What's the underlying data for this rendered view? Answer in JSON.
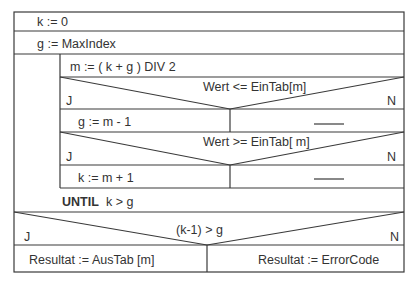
{
  "diagram": {
    "type": "Nassi-Shneiderman structogram",
    "statements": {
      "init_k": "k := 0",
      "init_g": "g := MaxIndex",
      "compute_m": "m := ( k + g )  DIV  2"
    },
    "loop": {
      "keyword": "UNTIL",
      "condition": "k > g",
      "decision1": {
        "condition": "Wert <= EinTab[m]",
        "yes_label": "J",
        "no_label": "N",
        "yes_action": "g := m - 1",
        "no_action": "——"
      },
      "decision2": {
        "condition": "Wert >= EinTab[ m]",
        "yes_label": "J",
        "no_label": "N",
        "yes_action": "k := m + 1",
        "no_action": "——"
      }
    },
    "final_decision": {
      "condition": "(k-1) > g",
      "yes_label": "J",
      "no_label": "N",
      "yes_action": "Resultat := AusTab [m]",
      "no_action": "Resultat := ErrorCode"
    }
  }
}
